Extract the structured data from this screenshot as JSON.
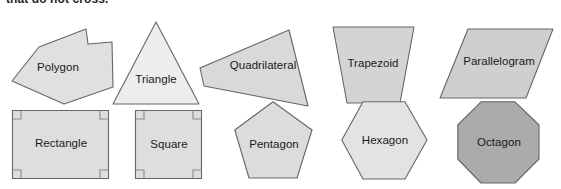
{
  "figure": {
    "caption": "that do not cross.",
    "background_color": "#ffffff"
  },
  "style": {
    "stroke_color": "#5a5a5a",
    "light_fill": "#e6e6e6",
    "lighter_fill": "#ededed",
    "mid_fill": "#d4d4d4",
    "dark_fill": "#a9a9a9",
    "label_color": "#1a1a1a"
  },
  "shapes": [
    {
      "name": "polygon",
      "label": "Polygon",
      "sides": 6,
      "fill": "#e0e0e0",
      "row": 1,
      "points": "31,29 78,11 80,26 104,24 105,69 56,86 4,63"
    },
    {
      "name": "triangle",
      "label": "Triangle",
      "sides": 3,
      "fill": "#ededed",
      "row": 1,
      "points": "43,2 86,84 0,84"
    },
    {
      "name": "quadrilateral",
      "label": "Quadrilateral",
      "sides": 4,
      "fill": "#d9d9d9",
      "row": 1,
      "points": "0,44 89,6 108,82 4,62"
    },
    {
      "name": "trapezoid",
      "label": "Trapezoid",
      "sides": 4,
      "fill": "#d4d4d4",
      "row": 1,
      "points": "5,3 86,3 72,79 19,79"
    },
    {
      "name": "parallelogram",
      "label": "Parallelogram",
      "sides": 4,
      "fill": "#cfcfcf",
      "row": 1,
      "points": "28,4 113,4 86,73 0,73"
    },
    {
      "name": "rectangle",
      "label": "Rectangle",
      "sides": 4,
      "fill": "#dedede",
      "row": 2,
      "right_angle_marks": 4,
      "points": "0,0 96,0 96,68 0,68"
    },
    {
      "name": "square",
      "label": "Square",
      "sides": 4,
      "fill": "#dedede",
      "row": 2,
      "right_angle_marks": 4,
      "points": "0,0 66,0 66,68 0,68"
    },
    {
      "name": "pentagon",
      "label": "Pentagon",
      "sides": 5,
      "fill": "#dcdcdc",
      "row": 2,
      "points": "39,0 78,29 63,77 15,77 0,29"
    },
    {
      "name": "hexagon",
      "label": "Hexagon",
      "sides": 6,
      "fill": "#e3e3e3",
      "row": 2,
      "points": "22,0 64,0 86,39 64,78 22,78 0,39"
    },
    {
      "name": "octagon",
      "label": "Octagon",
      "sides": 8,
      "fill": "#ababab",
      "row": 2,
      "points": "24,0 58,0 82,24 82,58 58,82 24,82 0,58 0,24"
    }
  ]
}
